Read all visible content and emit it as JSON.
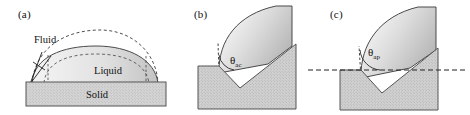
{
  "figure": {
    "type": "diagram",
    "background_color": "#ffffff",
    "panels": [
      {
        "id": "a",
        "label": "(a)",
        "label_x": 18,
        "label_y": 16,
        "description": "Sessile droplet on a flat solid substrate with dashed construction arcs showing alternate drop profiles",
        "texts": {
          "fluid": "Fluid",
          "liquid": "Liquid",
          "solid": "Solid"
        },
        "text_positions": {
          "fluid": {
            "x": 34,
            "y": 43
          },
          "liquid": {
            "x": 108,
            "y": 74
          },
          "solid": {
            "x": 97,
            "y": 95
          }
        },
        "substrate": {
          "x": 26,
          "y": 82,
          "width": 140,
          "height": 24,
          "fill": "#d2d2d2",
          "stroke": "#555555"
        },
        "droplet": {
          "fill_left": "#efefef",
          "fill_right": "#c8c8c8",
          "stroke": "#4a4a4a"
        },
        "dashed_arc": {
          "stroke": "#3a3a3a",
          "dash": "3,2.5"
        }
      },
      {
        "id": "b",
        "label": "(b)",
        "label_x": 22,
        "label_y": 16,
        "description": "Droplet pinned at a notch edge on an inclined substrate, actual contact angle measured from the local solid surface",
        "angle": {
          "symbol": "θ",
          "subscript": "ac",
          "name": "actual-contact-angle",
          "x": 58,
          "y": 62
        },
        "substrate": {
          "fill": "#cfcfcf",
          "stroke": "#555555"
        },
        "droplet": {
          "fill_left": "#f2f2f2",
          "fill_right": "#b9b9b9",
          "stroke": "#4a4a4a"
        },
        "tangent_line": {
          "stroke": "#333333",
          "dash": "2.5,2"
        }
      },
      {
        "id": "c",
        "label": "(c)",
        "label_x": 24,
        "label_y": 16,
        "description": "Same droplet and notch with a horizontal reference line, apparent contact angle measured from the horizontal",
        "angle": {
          "symbol": "θ",
          "subscript": "ap",
          "name": "apparent-contact-angle",
          "x": 62,
          "y": 54
        },
        "substrate": {
          "fill": "#cfcfcf",
          "stroke": "#555555"
        },
        "droplet": {
          "fill_left": "#f2f2f2",
          "fill_right": "#b9b9b9",
          "stroke": "#4a4a4a"
        },
        "reference_line": {
          "name": "horizontal-datum",
          "y": 70,
          "x1": 2,
          "x2": 162,
          "stroke": "#222222",
          "dash": "5,3"
        },
        "tangent_line": {
          "stroke": "#333333",
          "dash": "2.5,2"
        }
      }
    ]
  }
}
